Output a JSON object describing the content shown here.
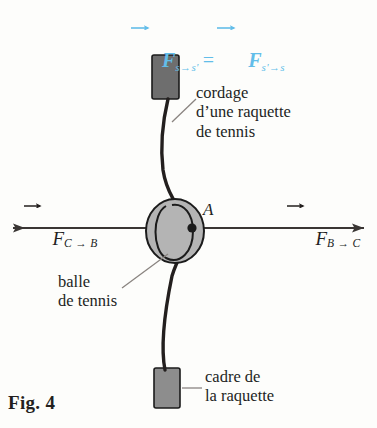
{
  "figure": {
    "caption": "Fig. 4",
    "background_color": "#fdfdfb",
    "ink_color": "#231f1e"
  },
  "formula": {
    "accent_color": "#62bde9",
    "left_symbol": "F",
    "left_subscript": "s→s'",
    "operator": "=",
    "right_symbol": "F",
    "right_subscript": "s'→s",
    "full_text": "F⃗(s→s') = F⃗(s'→s)"
  },
  "vectors": {
    "left": {
      "symbol": "F",
      "subscript": "C → B",
      "direction": "left",
      "arrow_color": "#3a3634"
    },
    "right": {
      "symbol": "F",
      "subscript": "B → C",
      "direction": "right",
      "arrow_color": "#3a3634"
    }
  },
  "point": {
    "label": "A",
    "marker": "contact-point-dot",
    "color": "#1b1b1b"
  },
  "annotations": [
    {
      "name": "string",
      "text": "cordage\nd’une raquette\nde tennis"
    },
    {
      "name": "ball",
      "text": "balle\nde tennis"
    },
    {
      "name": "frame",
      "text": "cadre de\nla raquette"
    }
  ],
  "objects": {
    "ball": {
      "name": "tennis-ball",
      "fill": "#b4b4b4",
      "stroke": "#1b1b1b",
      "seam": "u-shaped-seam"
    },
    "frame_top": {
      "name": "racket-frame-top",
      "fill": "#6e6e6e",
      "stroke": "#1b1b1b"
    },
    "frame_bottom": {
      "name": "racket-frame-bottom",
      "fill": "#8d8d8d",
      "stroke": "#1b1b1b"
    },
    "string": {
      "name": "racket-string",
      "stroke": "#231f1e",
      "description": "curved string deflected by the ball at point A"
    }
  }
}
